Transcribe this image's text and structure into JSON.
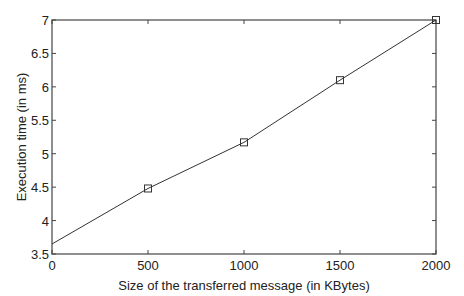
{
  "chart_data": {
    "type": "line",
    "title": "",
    "xlabel": "Size of the transferred message (in KBytes)",
    "ylabel": "Execution time (in ms)",
    "xlim": [
      0,
      2000
    ],
    "ylim": [
      3.5,
      7
    ],
    "xticks": [
      "0",
      "500",
      "1000",
      "1500",
      "2000"
    ],
    "yticks": [
      "3.5",
      "4",
      "4.5",
      "5",
      "5.5",
      "6",
      "6.5",
      "7"
    ],
    "grid": false,
    "legend": null,
    "series": [
      {
        "name": "Execution time",
        "marker": "square",
        "color": "#333333",
        "x": [
          0,
          500,
          1000,
          1500,
          2000
        ],
        "values": [
          3.65,
          4.48,
          5.17,
          6.1,
          7.0
        ]
      }
    ]
  }
}
